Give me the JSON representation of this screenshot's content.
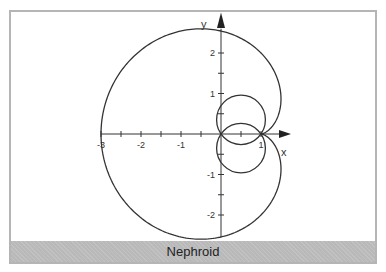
{
  "figure": {
    "caption": "Nephroid",
    "axes": {
      "x_label": "x",
      "y_label": "y",
      "x_ticks": [
        "-3",
        "-2",
        "-1",
        "1"
      ],
      "y_ticks": [
        "2",
        "1",
        "-1",
        "-2"
      ]
    },
    "colors": {
      "curve": "#333333",
      "axis": "#333333",
      "caption_band": "#b9b9b9",
      "frame": "#b5b5b5"
    }
  },
  "chart_data": {
    "type": "line",
    "title": "Nephroid",
    "xlabel": "x",
    "ylabel": "y",
    "xlim": [
      -3,
      1.5
    ],
    "ylim": [
      -2.6,
      2.6
    ],
    "x_ticks": [
      -3,
      -2.5,
      -2,
      -1.5,
      -1,
      -0.5,
      0.5,
      1
    ],
    "x_tick_labels": [
      "-3",
      "-2",
      "-1",
      "1"
    ],
    "y_ticks": [
      -2,
      -1.5,
      -1,
      -0.5,
      0.5,
      1,
      1.5,
      2
    ],
    "y_tick_labels": [
      "2",
      "1",
      "-1",
      "-2"
    ],
    "grid": false,
    "series": [
      {
        "name": "outer-loop",
        "form": "polar about (1,0): r = 2(1 - cos φ)",
        "key_points": [
          [
            1,
            0
          ],
          [
            -0.5,
            2.6
          ],
          [
            -3,
            0
          ],
          [
            -0.5,
            -2.6
          ],
          [
            1.5,
            0.87
          ],
          [
            1.5,
            -0.87
          ]
        ]
      },
      {
        "name": "inner-loop-upper",
        "form": "circle through (0,0) and (1,0)",
        "center": [
          0.5,
          0.35
        ],
        "radius": 0.61
      },
      {
        "name": "inner-loop-lower",
        "form": "circle through (0,0) and (1,0)",
        "center": [
          0.5,
          -0.35
        ],
        "radius": 0.61
      }
    ]
  }
}
